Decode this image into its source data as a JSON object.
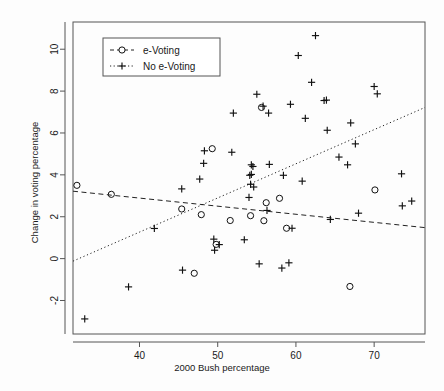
{
  "chart_data": {
    "type": "scatter",
    "title": "",
    "xlabel": "2000 Bush percentage",
    "ylabel": "Change in voting percentage",
    "xlim": [
      31.5,
      76.5
    ],
    "ylim": [
      -3.6,
      11.3
    ],
    "xticks": [
      40,
      50,
      60,
      70
    ],
    "yticks": [
      -2,
      0,
      2,
      4,
      6,
      8,
      10
    ],
    "grid": false,
    "legend_position": "top-left",
    "series": [
      {
        "name": "e-Voting",
        "marker": "circle",
        "line_style": "dashed",
        "points": [
          [
            32.0,
            3.5
          ],
          [
            36.4,
            3.07
          ],
          [
            45.4,
            2.37
          ],
          [
            47.0,
            -0.7
          ],
          [
            47.9,
            2.1
          ],
          [
            49.3,
            5.25
          ],
          [
            49.8,
            0.68
          ],
          [
            51.6,
            1.82
          ],
          [
            54.2,
            2.05
          ],
          [
            55.6,
            7.22
          ],
          [
            55.9,
            1.81
          ],
          [
            56.2,
            2.67
          ],
          [
            57.9,
            2.88
          ],
          [
            58.8,
            1.45
          ],
          [
            66.9,
            -1.33
          ],
          [
            70.1,
            3.28
          ]
        ],
        "trend": {
          "x": [
            31.5,
            76.5
          ],
          "y": [
            3.22,
            1.48
          ]
        }
      },
      {
        "name": "No e-Voting",
        "marker": "plus",
        "line_style": "dotted",
        "points": [
          [
            33.0,
            -2.88
          ],
          [
            38.6,
            -1.35
          ],
          [
            41.9,
            1.44
          ],
          [
            45.4,
            3.33
          ],
          [
            45.5,
            -0.55
          ],
          [
            47.7,
            3.8
          ],
          [
            48.2,
            4.55
          ],
          [
            48.3,
            5.15
          ],
          [
            49.5,
            0.93
          ],
          [
            49.6,
            0.4
          ],
          [
            50.2,
            0.67
          ],
          [
            51.8,
            5.08
          ],
          [
            52.0,
            6.95
          ],
          [
            53.4,
            0.9
          ],
          [
            54.0,
            2.92
          ],
          [
            54.1,
            3.98
          ],
          [
            54.2,
            3.55
          ],
          [
            54.3,
            4.02
          ],
          [
            54.3,
            4.48
          ],
          [
            54.5,
            4.4
          ],
          [
            54.6,
            3.42
          ],
          [
            55.0,
            7.85
          ],
          [
            55.3,
            -0.25
          ],
          [
            55.8,
            7.28
          ],
          [
            56.3,
            2.3
          ],
          [
            56.5,
            6.95
          ],
          [
            56.6,
            4.5
          ],
          [
            58.2,
            -0.45
          ],
          [
            58.4,
            3.98
          ],
          [
            59.1,
            -0.2
          ],
          [
            59.3,
            7.37
          ],
          [
            59.5,
            1.45
          ],
          [
            60.3,
            9.7
          ],
          [
            60.8,
            3.7
          ],
          [
            61.2,
            6.7
          ],
          [
            62.0,
            8.42
          ],
          [
            62.5,
            10.65
          ],
          [
            63.6,
            7.55
          ],
          [
            63.9,
            7.57
          ],
          [
            64.0,
            6.13
          ],
          [
            65.5,
            4.85
          ],
          [
            66.6,
            4.48
          ],
          [
            67.0,
            6.48
          ],
          [
            67.6,
            5.48
          ],
          [
            68.0,
            2.17
          ],
          [
            64.4,
            1.87
          ],
          [
            70.0,
            8.22
          ],
          [
            70.4,
            7.87
          ],
          [
            73.5,
            4.05
          ],
          [
            73.6,
            2.52
          ],
          [
            74.8,
            2.75
          ]
        ],
        "trend": {
          "x": [
            31.5,
            76.5
          ],
          "y": [
            -0.12,
            7.22
          ]
        }
      }
    ]
  },
  "legend": {
    "entries": [
      {
        "label": "e-Voting",
        "marker": "circle",
        "line_style": "dashed"
      },
      {
        "label": "No e-Voting",
        "marker": "plus",
        "line_style": "dotted"
      }
    ]
  }
}
